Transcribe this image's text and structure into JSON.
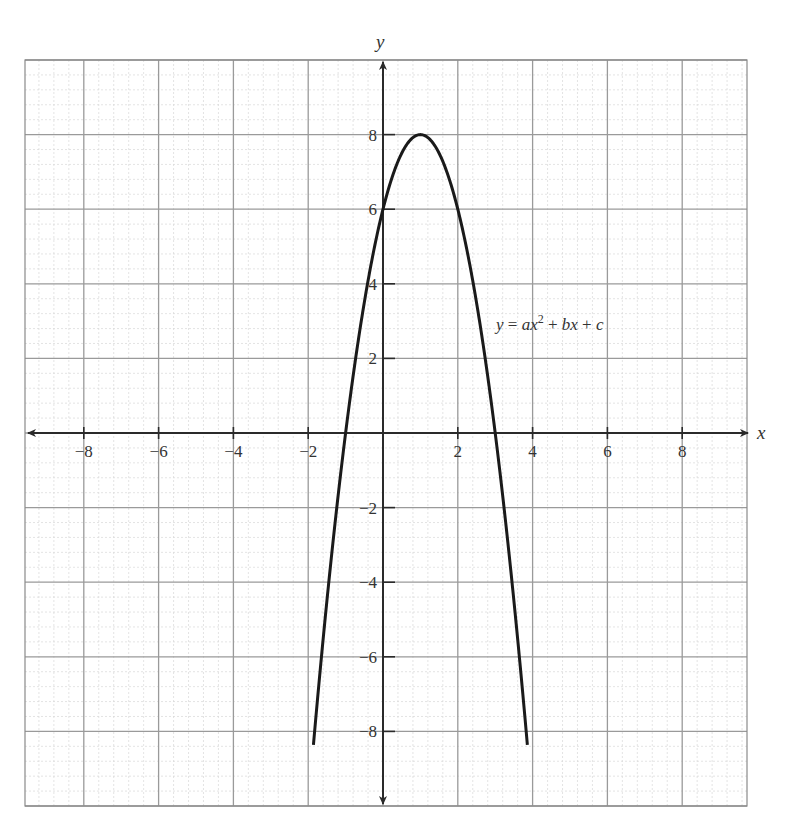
{
  "chart_data": {
    "type": "line",
    "title": "",
    "xlabel": "x",
    "ylabel": "y",
    "xlim": [
      -9.6,
      9.7
    ],
    "ylim": [
      -10,
      10
    ],
    "grid": true,
    "grid_major_step": 2,
    "grid_minor_step": 0.4,
    "x_ticks": [
      -8,
      -6,
      -4,
      -2,
      2,
      4,
      6,
      8
    ],
    "y_ticks": [
      -8,
      -6,
      -4,
      -2,
      2,
      4,
      6,
      8
    ],
    "x_tick_labels": [
      "−8",
      "−6",
      "−4",
      "−2",
      "2",
      "4",
      "6",
      "8"
    ],
    "y_tick_labels": [
      "−8",
      "−6",
      "−4",
      "−2",
      "2",
      "4",
      "6",
      "8"
    ],
    "series": [
      {
        "name": "y = ax^2 + bx + c",
        "equation_label": "y = ax² + bx + c",
        "coefficients": {
          "a": -2,
          "b": 4,
          "c": 6
        },
        "vertex": [
          1,
          8
        ],
        "y_intercept": [
          0,
          6
        ],
        "x_intercepts": [
          -1,
          3
        ],
        "x": [
          -1.85,
          -1.5,
          -1,
          -0.5,
          0,
          0.5,
          1,
          1.5,
          2,
          2.5,
          3,
          3.5,
          3.85
        ],
        "y": [
          -10.0,
          -6.5,
          0,
          3.5,
          6,
          7.5,
          8,
          7.5,
          6,
          3.5,
          0,
          -4.5,
          -10.0
        ]
      }
    ],
    "annotations": [
      {
        "text": "y = ax² + bx + c",
        "x": 3.1,
        "y": 2.9
      }
    ]
  },
  "labels": {
    "x_axis": "x",
    "y_axis": "y",
    "equation_y": "y",
    "equation_eq": " = ",
    "equation_ax": "ax",
    "equation_sup": "2",
    "equation_rest_plus1": " + ",
    "equation_bx": "bx",
    "equation_rest_plus2": " + ",
    "equation_c": "c"
  },
  "colors": {
    "curve": "#1a1a1a",
    "axes": "#2a2a2a",
    "major_grid": "#9a9a9a",
    "minor_grid": "#d8d8d8",
    "background": "#ffffff"
  }
}
